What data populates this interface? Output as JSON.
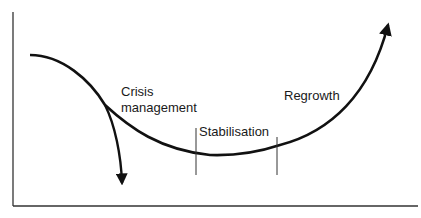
{
  "diagram": {
    "type": "lifecycle-curve",
    "labels": {
      "crisis_line1": "Crisis",
      "crisis_line2": "management",
      "stabilisation": "Stabilisation",
      "regrowth": "Regrowth"
    },
    "stroke_color": "#111111",
    "axis_color": "#333333"
  }
}
